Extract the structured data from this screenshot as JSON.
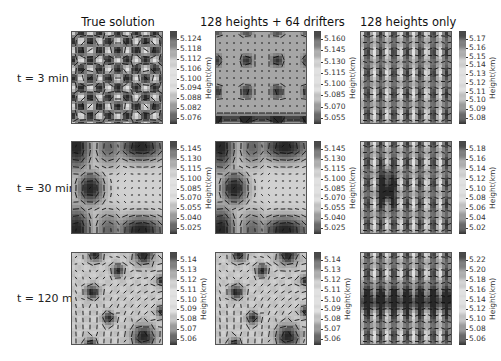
{
  "chart_data": {
    "type": "heatmap",
    "title": "",
    "columns": [
      "True solution",
      "128 heights + 64 drifters",
      "128 heights only"
    ],
    "rows": [
      "t = 3 min",
      "t = 30 min",
      "t = 120 min"
    ],
    "colorbar_label": "Height(km)",
    "colormap": "gray (dark = high/low extremes, light = mid)",
    "panels": [
      {
        "row": 0,
        "col": 0,
        "ticks": [
          "5.124",
          "5.118",
          "5.112",
          "5.106",
          "5.100",
          "5.094",
          "5.088",
          "5.082",
          "5.076"
        ],
        "range": [
          5.073,
          5.127
        ]
      },
      {
        "row": 0,
        "col": 1,
        "ticks": [
          "5.160",
          "5.145",
          "5.130",
          "5.115",
          "5.100",
          "5.085",
          "5.070",
          "5.055"
        ],
        "range": [
          5.048,
          5.166
        ]
      },
      {
        "row": 0,
        "col": 2,
        "ticks": [
          "5.17",
          "5.16",
          "5.15",
          "5.14",
          "5.13",
          "5.12",
          "5.11",
          "5.10",
          "5.09",
          "5.08"
        ],
        "range": [
          5.075,
          5.175
        ]
      },
      {
        "row": 1,
        "col": 0,
        "ticks": [
          "5.145",
          "5.130",
          "5.115",
          "5.100",
          "5.085",
          "5.070",
          "5.055",
          "5.040",
          "5.025"
        ],
        "range": [
          5.018,
          5.15
        ]
      },
      {
        "row": 1,
        "col": 1,
        "ticks": [
          "5.145",
          "5.130",
          "5.115",
          "5.100",
          "5.085",
          "5.070",
          "5.055",
          "5.040",
          "5.025"
        ],
        "range": [
          5.018,
          5.15
        ]
      },
      {
        "row": 1,
        "col": 2,
        "ticks": [
          "5.18",
          "5.16",
          "5.14",
          "5.12",
          "5.10",
          "5.08",
          "5.06",
          "5.04",
          "5.02"
        ],
        "range": [
          5.012,
          5.192
        ]
      },
      {
        "row": 2,
        "col": 0,
        "ticks": [
          "5.14",
          "5.13",
          "5.12",
          "5.11",
          "5.10",
          "5.09",
          "5.08",
          "5.07",
          "5.06"
        ],
        "range": [
          5.055,
          5.147
        ]
      },
      {
        "row": 2,
        "col": 1,
        "ticks": [
          "5.14",
          "5.13",
          "5.12",
          "5.11",
          "5.10",
          "5.09",
          "5.08",
          "5.07",
          "5.06"
        ],
        "range": [
          5.055,
          5.147
        ]
      },
      {
        "row": 2,
        "col": 2,
        "ticks": [
          "5.22",
          "5.20",
          "5.18",
          "5.16",
          "5.14",
          "5.12",
          "5.10",
          "5.08",
          "5.06"
        ],
        "range": [
          5.052,
          5.232
        ]
      }
    ]
  },
  "titles": {
    "col0": "True solution",
    "col1": "128 heights + 64 drifters",
    "col2": "128 heights only"
  },
  "rows": {
    "row0": "t = 3 min",
    "row1": "t = 30 min",
    "row2": "t = 120 min"
  },
  "colorbar_label": "Height(km)"
}
